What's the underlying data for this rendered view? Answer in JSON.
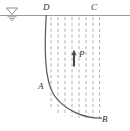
{
  "figure": {
    "kind": "geotechnical-slip-surface-diagram",
    "canvas": {
      "width": 130,
      "height": 131,
      "background": "#ffffff"
    },
    "colors": {
      "ground_line": "#9a9a9a",
      "slip_curve": "#5a5a5a",
      "flow_line_dashed": "#b0aeae",
      "arrow": "#4a4a4a",
      "label_text": "#2e2e2e",
      "water_table_symbol": "#8d8d8d"
    },
    "labels": {
      "D": "D",
      "C": "C",
      "A": "A",
      "B": "B",
      "P": "P"
    },
    "icons": {
      "water_table": "water-table-icon",
      "pore_pressure_arrow": "up-arrow-icon"
    },
    "geometry": {
      "ground_surface_line": {
        "x1": 0,
        "y": 15,
        "x2": 130
      },
      "water_table_symbol": {
        "cx": 12,
        "cy": 12
      },
      "slip_surface_path": "M 46 15 C 44 55 45 85 62 103 C 76 117 92 119 102 118",
      "pore_pressure_arrow": {
        "x": 74,
        "y_tail": 66,
        "y_head": 51
      },
      "dashed_flow_lines": [
        {
          "x": 51,
          "y_top": 17,
          "y_bottom": 110
        },
        {
          "x": 58,
          "y_top": 17,
          "y_bottom": 113
        },
        {
          "x": 65,
          "y_top": 17,
          "y_bottom": 116
        },
        {
          "x": 72,
          "y_top": 17,
          "y_bottom": 117
        },
        {
          "x": 79,
          "y_top": 17,
          "y_bottom": 118
        },
        {
          "x": 86,
          "y_top": 17,
          "y_bottom": 118
        },
        {
          "x": 93,
          "y_top": 17,
          "y_bottom": 118
        },
        {
          "x": 99,
          "y_top": 17,
          "y_bottom": 118
        }
      ]
    }
  }
}
